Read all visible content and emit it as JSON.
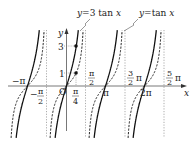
{
  "diagram": {
    "curves": [
      {
        "label_prefix": "y",
        "label_eq": "=3 tan ",
        "label_var": "x",
        "style": "solid"
      },
      {
        "label_prefix": "y",
        "label_eq": "=tan ",
        "label_var": "x",
        "style": "dashed"
      }
    ],
    "axes": {
      "x_label": "x",
      "y_label": "y",
      "origin_label": "O"
    },
    "y_ticks": [
      "3",
      "1"
    ],
    "x_ticks": {
      "neg_pi": "−π",
      "neg_half_pi_num": "π",
      "neg_half_pi_den": "2",
      "neg_sign": "−",
      "quarter_pi_num": "π",
      "quarter_pi_den": "4",
      "half_pi_num": "π",
      "half_pi_den": "2",
      "pi": "π",
      "three_half_num": "3",
      "three_half_den": "2",
      "three_half_pi": "π",
      "two_pi": "2π",
      "five_half_num": "5",
      "five_half_den": "2",
      "five_half_pi": "π"
    },
    "points": [
      {
        "x": "π/4",
        "y": "3",
        "curve": "y=3tan x"
      },
      {
        "x": "π/4",
        "y": "1",
        "curve": "y=tan x"
      }
    ]
  }
}
